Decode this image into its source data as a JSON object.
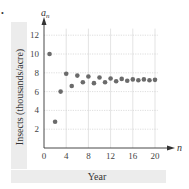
{
  "chart_data": {
    "type": "scatter",
    "title": "",
    "xlabel": "Year",
    "ylabel": "Insects (thousands/acre)",
    "x_axis_name": "n",
    "y_axis_name": "a",
    "y_axis_subscript": "n",
    "xlim": [
      0,
      21
    ],
    "ylim": [
      0,
      13
    ],
    "x_ticks": [
      "0",
      "4",
      "8",
      "12",
      "16",
      "20"
    ],
    "y_ticks": [
      "2",
      "4",
      "6",
      "8",
      "10",
      "12"
    ],
    "grid": true,
    "legend": "none",
    "points_color": "#6b6b6b",
    "x": [
      1,
      2,
      3,
      4,
      5,
      6,
      7,
      8,
      9,
      10,
      11,
      12,
      13,
      14,
      15,
      16,
      17,
      18,
      19,
      20
    ],
    "y": [
      10.0,
      2.8,
      6.0,
      7.9,
      6.6,
      7.7,
      7.0,
      7.6,
      6.9,
      7.5,
      7.0,
      7.4,
      7.1,
      7.35,
      7.15,
      7.3,
      7.2,
      7.3,
      7.2,
      7.25
    ]
  },
  "labels": {
    "xlabel": "Year",
    "ylabel": "Insects (thousands/acre)",
    "bullet": "•"
  }
}
